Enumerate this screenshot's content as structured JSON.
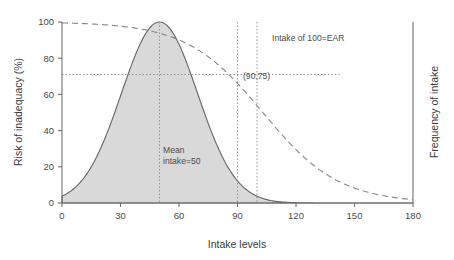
{
  "chart_data": {
    "type": "line",
    "title": "",
    "xlabel": "Intake levels",
    "ylabel": "Risk of inadequacy (%)",
    "y2label": "Frequency of intake",
    "xlim": [
      0,
      180
    ],
    "ylim": [
      0,
      100
    ],
    "grid": false,
    "legend": "none",
    "xticks": [
      0,
      30,
      60,
      90,
      120,
      150,
      180
    ],
    "xtick_labels": [
      "0",
      "30",
      "60",
      "90",
      "120",
      "150",
      "180"
    ],
    "yticks": [
      0,
      20,
      40,
      60,
      80,
      100
    ],
    "ytick_labels": [
      "0",
      "20",
      "40",
      "60",
      "80",
      "100"
    ],
    "series": [
      {
        "name": "Risk of inadequacy",
        "style": "dashed",
        "axis": "left",
        "x": [
          0,
          10,
          20,
          30,
          40,
          50,
          60,
          70,
          80,
          90,
          100,
          110,
          120,
          130,
          140,
          150,
          160,
          170,
          180
        ],
        "values": [
          100,
          100,
          100,
          99.5,
          99,
          98,
          96,
          92,
          85,
          75,
          62,
          47,
          33,
          21,
          12,
          6,
          3,
          1.2,
          0.5
        ]
      },
      {
        "name": "Frequency of intake",
        "style": "solid-filled",
        "axis": "right",
        "x": [
          0,
          10,
          20,
          30,
          40,
          50,
          60,
          70,
          80,
          90,
          100,
          110,
          120,
          130,
          140,
          150,
          160,
          170,
          180
        ],
        "values": [
          4,
          10,
          26,
          55,
          86,
          100,
          86,
          55,
          26,
          10,
          3.5,
          1.5,
          0.8,
          0.5,
          0.3,
          0.2,
          0.15,
          0.1,
          0.1
        ]
      }
    ],
    "annotations": [
      {
        "id": "ear-note",
        "text": "Intake of 100=EAR",
        "x": 100,
        "y": 88
      },
      {
        "id": "point-label",
        "text": "(90,75)",
        "x": 92,
        "y": 71
      },
      {
        "id": "mean-note-line1",
        "text": "Mean",
        "x": 52,
        "y": 25
      },
      {
        "id": "mean-note-line2",
        "text": "intake=50",
        "x": 52,
        "y": 19
      }
    ],
    "guides": [
      {
        "id": "mean-intake-vline",
        "orientation": "vertical",
        "value": 50
      },
      {
        "id": "intake-90-vline",
        "orientation": "vertical",
        "value": 90
      },
      {
        "id": "ear-100-vline",
        "orientation": "vertical",
        "value": 100
      },
      {
        "id": "risk-71-hline",
        "orientation": "horizontal",
        "value": 71
      }
    ],
    "colors": {
      "fill": "#d9d9d9",
      "stroke": "#6a6a6a",
      "dashed_stroke": "#8a8a8a",
      "axis": "#6f6f6f",
      "text": "#3a3a3a"
    }
  }
}
